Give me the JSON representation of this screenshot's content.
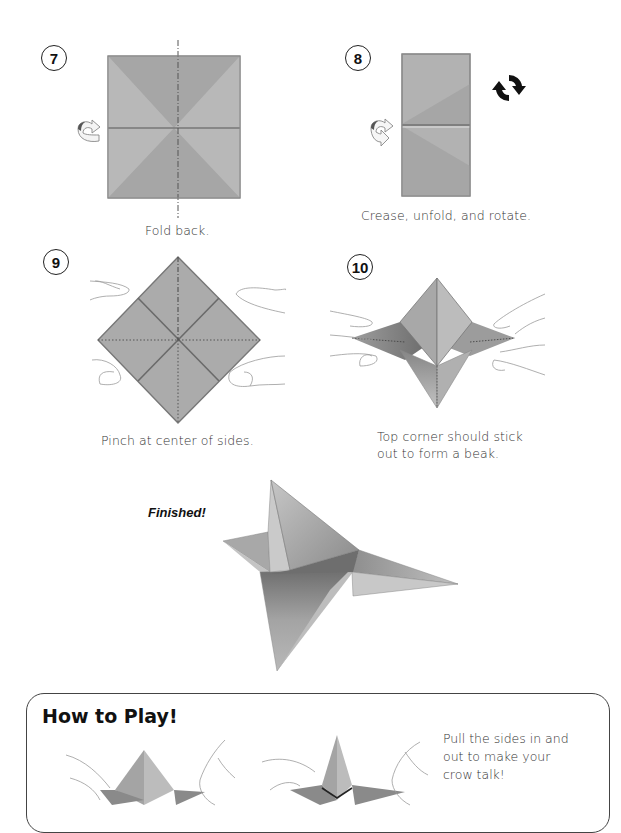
{
  "steps": [
    {
      "number": "7",
      "caption": "Fold back.",
      "icon": "fold-back-arrow-icon"
    },
    {
      "number": "8",
      "caption": "Crease, unfold, and rotate.",
      "icon": "rotate-icon"
    },
    {
      "number": "9",
      "caption": "Pinch at center of sides."
    },
    {
      "number": "10",
      "caption_line1": "Top corner should stick",
      "caption_line2": "out to form a beak."
    }
  ],
  "finished": {
    "label": "Finished!"
  },
  "how_to_play": {
    "title": "How to Play!",
    "text_line1": "Pull the sides in and",
    "text_line2": "out to make your",
    "text_line3": "crow talk!"
  },
  "colors": {
    "paper": "#a8a8a8",
    "paper_light": "#bdbdbd",
    "paper_dark": "#8c8c8c",
    "crease": "#6a6a6a",
    "outline": "#888888",
    "hand_line": "#9a9a9a",
    "text": "#333333"
  }
}
